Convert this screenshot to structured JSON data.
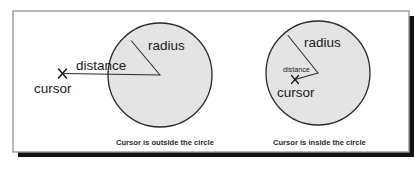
{
  "figure": {
    "background_color": "#ffffff",
    "panel": {
      "fill": "#ffffff",
      "border_color": "#9b9b9b",
      "shadow_color": "#121212"
    },
    "circle_fill": "#e4e4e4",
    "circle_stroke": "#2a2a2a",
    "line_color": "#2a2a2a",
    "text_color": "#1a1a1a",
    "caption_color": "#2b2b2b"
  },
  "diagrams": [
    {
      "id": "cursor-outside",
      "caption": "Cursor is outside the circle",
      "radius_label": "radius",
      "distance_label": "distance",
      "cursor_label": "cursor",
      "cursor_position": "outside",
      "cursor_marker": "x-cross"
    },
    {
      "id": "cursor-inside",
      "caption": "Cursor is inside the circle",
      "radius_label": "radius",
      "distance_label": "distance",
      "cursor_label": "cursor",
      "cursor_position": "inside",
      "cursor_marker": "x-cross"
    }
  ]
}
